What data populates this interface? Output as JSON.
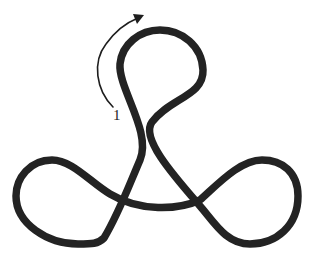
{
  "diagram": {
    "type": "knot-diagram",
    "colors": {
      "background": "#ffffff",
      "strand": "#232323",
      "arrow": "#1e1e1e"
    },
    "lobes": [
      "top",
      "left",
      "right"
    ],
    "crossings": 3,
    "arrow": {
      "label": "1",
      "direction": "clockwise-up"
    }
  }
}
